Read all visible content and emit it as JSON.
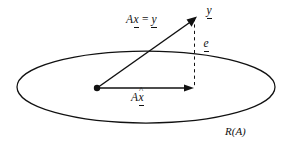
{
  "figure": {
    "type": "vector-diagram",
    "background_color": "#ffffff",
    "stroke_color": "#111111",
    "width": 293,
    "height": 153
  },
  "labels": {
    "equation": {
      "operator": "A",
      "vector_x": "x",
      "equals": "=",
      "vector_y": "y",
      "full_text": "Ax = y"
    },
    "target_vector": {
      "symbol": "y",
      "full_text": "y"
    },
    "residual_vector": {
      "symbol": "e",
      "full_text": "e"
    },
    "projection_vector": {
      "operator": "A",
      "symbol": "x",
      "accent": "^",
      "full_text": "Ax̂"
    },
    "range_subspace": {
      "full_text": "R(A)"
    }
  },
  "geometry": {
    "ellipse": {
      "cx": 146,
      "cy": 87,
      "rx": 129,
      "ry": 36
    },
    "origin_point": {
      "x": 97,
      "y": 88
    },
    "vector_y_tip": {
      "x": 196,
      "y": 17
    },
    "vector_projection_tip": {
      "x": 193,
      "y": 88
    },
    "residual_line": {
      "x": 194,
      "y_top": 17,
      "y_bottom": 88
    }
  }
}
